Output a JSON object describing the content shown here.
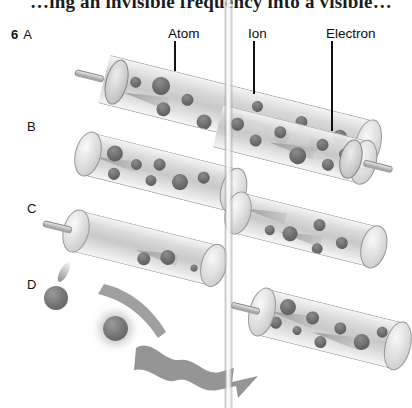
{
  "figure": {
    "caption_partial": "…ing an invisible frequency into a visible…",
    "number": "6",
    "background_color": "#ffffff",
    "particle_color": "#666666",
    "tube_color": "#d6d6d6",
    "label_color": "#111111"
  },
  "row_labels": [
    {
      "number": "6",
      "letter": "A"
    },
    {
      "number": "",
      "letter": "B"
    },
    {
      "number": "",
      "letter": "C"
    },
    {
      "number": "",
      "letter": "D"
    }
  ],
  "callouts": [
    {
      "label": "Atom",
      "leader_length_px": 30
    },
    {
      "label": "Ion",
      "leader_length_px": 53
    },
    {
      "label": "Electron",
      "leader_length_px": 90
    }
  ],
  "rows": {
    "a": {
      "letter": "A",
      "tubes": 1,
      "description": "single long tube with piston rod at left end, filled with atoms and ions"
    },
    "b": {
      "letter": "B",
      "tubes": 2,
      "description": "two tubes, right tube has piston and rod at right end"
    },
    "c": {
      "letter": "C",
      "tubes": 2,
      "description": "two tubes, left tube has rod at left end"
    },
    "d": {
      "letter": "D",
      "tubes": 1,
      "description": "free particles with tails, curved ribbons and a wavy emission arrow, one tube at right"
    }
  },
  "vertical_rod": {
    "name": "vertical-translucent-rod",
    "x_px": 228
  }
}
